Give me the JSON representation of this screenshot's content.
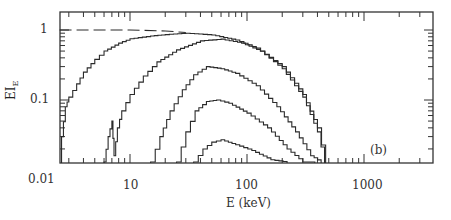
{
  "chart_data": {
    "type": "line",
    "title": "",
    "panel_label": "(b)",
    "xlabel": "E (keV)",
    "ylabel": "EI",
    "ylabel_subscript": "E",
    "xscale": "log",
    "yscale": "log",
    "xlim": [
      2.5,
      3500
    ],
    "ylim": [
      0.013,
      1.4
    ],
    "x_ticks": [
      {
        "value": 10,
        "label": "10"
      },
      {
        "value": 100,
        "label": "100"
      },
      {
        "value": 1000,
        "label": "1000"
      }
    ],
    "y_ticks": [
      {
        "value": 1,
        "label": "1"
      },
      {
        "value": 0.1,
        "label": "0.1"
      },
      {
        "value": 0.01,
        "label": "0.01"
      }
    ],
    "grid": false,
    "legend": null,
    "series": [
      {
        "name": "reference (dashed)",
        "style": "dashed",
        "x": [
          2.5,
          10,
          20,
          30
        ],
        "y": [
          1.0,
          1.0,
          0.97,
          0.92
        ]
      },
      {
        "name": "spectrum 1",
        "style": "step",
        "x": [
          2.6,
          2.8,
          3,
          3.5,
          4,
          5,
          6,
          8,
          10,
          15,
          20,
          30,
          50,
          80,
          120,
          200,
          300,
          400,
          470
        ],
        "y": [
          0.03,
          0.08,
          0.11,
          0.17,
          0.25,
          0.38,
          0.5,
          0.65,
          0.75,
          0.82,
          0.86,
          0.9,
          0.85,
          0.72,
          0.55,
          0.3,
          0.12,
          0.04,
          0.013
        ]
      },
      {
        "name": "spectrum 2",
        "style": "step",
        "x": [
          6,
          6.5,
          7,
          7.3,
          7.8,
          8.5,
          10,
          13,
          17,
          25,
          40,
          60,
          90,
          130,
          200,
          300,
          400,
          460
        ],
        "y": [
          0.013,
          0.03,
          0.05,
          0.016,
          0.04,
          0.07,
          0.12,
          0.22,
          0.35,
          0.52,
          0.7,
          0.74,
          0.65,
          0.5,
          0.28,
          0.11,
          0.035,
          0.013
        ]
      },
      {
        "name": "spectrum 3",
        "style": "step",
        "x": [
          15,
          18,
          22,
          28,
          35,
          45,
          60,
          80,
          120,
          180,
          260,
          350,
          430
        ],
        "y": [
          0.013,
          0.03,
          0.07,
          0.14,
          0.23,
          0.3,
          0.28,
          0.24,
          0.16,
          0.08,
          0.035,
          0.016,
          0.013
        ]
      },
      {
        "name": "spectrum 4",
        "style": "step",
        "x": [
          25,
          30,
          36,
          45,
          55,
          70,
          100,
          150,
          220,
          300,
          380
        ],
        "y": [
          0.013,
          0.035,
          0.07,
          0.095,
          0.1,
          0.09,
          0.065,
          0.04,
          0.02,
          0.013,
          0.013
        ]
      },
      {
        "name": "spectrum 5",
        "style": "step",
        "x": [
          35,
          42,
          50,
          60,
          80,
          110,
          160,
          220
        ],
        "y": [
          0.013,
          0.02,
          0.025,
          0.027,
          0.023,
          0.019,
          0.014,
          0.013
        ]
      }
    ]
  }
}
